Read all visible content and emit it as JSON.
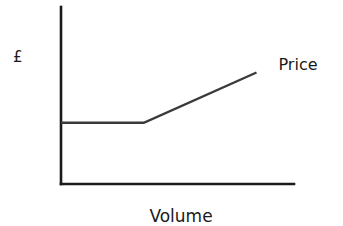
{
  "chart_data": {
    "type": "line",
    "title": "",
    "xlabel": "Volume",
    "ylabel": "£",
    "grid": false,
    "xlim": [
      0,
      10
    ],
    "ylim": [
      0,
      10
    ],
    "x_ticks": [],
    "y_ticks": [],
    "series": [
      {
        "name": "Price",
        "color": "#3a3a3a",
        "points": [
          {
            "x": 0,
            "y": 4.5
          },
          {
            "x": 3.6,
            "y": 4.5
          },
          {
            "x": 8.5,
            "y": 8.2
          }
        ]
      }
    ],
    "legend": "inline label at end of series (right)"
  },
  "colors": {
    "axis": "#1a1a1a",
    "series": "#3a3a3a",
    "background": "#ffffff"
  }
}
